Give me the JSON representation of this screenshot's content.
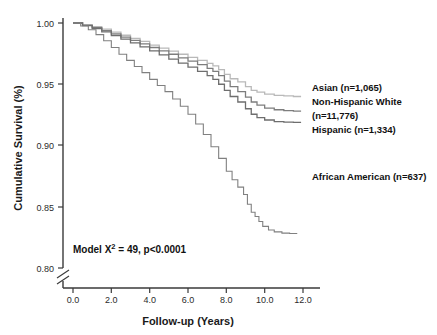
{
  "chart_data": {
    "type": "line",
    "title": "",
    "xlabel": "Follow-up (Years)",
    "ylabel": "Cumulative Survival (%)",
    "xlim": [
      0.0,
      12.0
    ],
    "ylim": [
      0.8,
      1.0
    ],
    "xticks": [
      "0.0",
      "2.0",
      "4.0",
      "6.0",
      "8.0",
      "10.0",
      "12.0"
    ],
    "xtick_values": [
      0.0,
      2.0,
      4.0,
      6.0,
      8.0,
      10.0,
      12.0
    ],
    "yticks": [
      "1.00",
      "0.95",
      "0.90",
      "0.85",
      "0.80"
    ],
    "ytick_values": [
      1.0,
      0.95,
      0.9,
      0.85,
      0.8
    ],
    "grid": false,
    "legend_position": "right-inline-labels",
    "axis_break": true,
    "axis_break_note": "y-axis broken below 0.80",
    "annotation": "Model X² = 49, p<0.0001",
    "annotation_parts": {
      "prefix": "Model X",
      "superscript": "2",
      "suffix": " = 49, p<0.0001"
    },
    "series": [
      {
        "name": "Asian",
        "label": "Asian (n=1,065)",
        "n": 1065,
        "color": "#b9b9b9",
        "final_value": 0.94,
        "x": [
          0.0,
          0.5,
          1.0,
          1.5,
          2.0,
          2.5,
          3.0,
          3.5,
          4.0,
          4.5,
          5.0,
          5.5,
          6.0,
          6.5,
          7.0,
          7.3,
          7.6,
          7.9,
          8.2,
          8.6,
          9.0,
          9.3,
          9.6,
          10.0,
          10.5,
          11.0,
          11.5,
          11.9
        ],
        "values": [
          1.0,
          0.9985,
          0.997,
          0.995,
          0.9925,
          0.99,
          0.9875,
          0.985,
          0.982,
          0.9795,
          0.977,
          0.9745,
          0.972,
          0.9695,
          0.967,
          0.965,
          0.962,
          0.958,
          0.9545,
          0.952,
          0.948,
          0.945,
          0.9435,
          0.942,
          0.941,
          0.9405,
          0.94,
          0.94
        ]
      },
      {
        "name": "Non-Hispanic White",
        "label_line1": "Non-Hispanic White",
        "label_line2": "(n=11,776)",
        "label": "Non-Hispanic White (n=11,776)",
        "n": 11776,
        "color": "#7d7d7d",
        "final_value": 0.928,
        "x": [
          0.0,
          0.5,
          1.0,
          1.5,
          2.0,
          2.5,
          3.0,
          3.5,
          4.0,
          4.5,
          5.0,
          5.5,
          6.0,
          6.5,
          7.0,
          7.3,
          7.6,
          7.9,
          8.2,
          8.6,
          9.0,
          9.3,
          9.6,
          10.0,
          10.5,
          11.0,
          11.5,
          11.9
        ],
        "values": [
          1.0,
          0.9982,
          0.9962,
          0.9938,
          0.9912,
          0.9885,
          0.9858,
          0.983,
          0.98,
          0.9772,
          0.9745,
          0.9715,
          0.9688,
          0.966,
          0.963,
          0.9605,
          0.957,
          0.9525,
          0.948,
          0.944,
          0.9395,
          0.9355,
          0.933,
          0.9305,
          0.9292,
          0.9285,
          0.928,
          0.928
        ]
      },
      {
        "name": "Hispanic",
        "label": "Hispanic (n=1,334)",
        "n": 1334,
        "color": "#6e6e6e",
        "final_value": 0.919,
        "x": [
          0.0,
          0.5,
          1.0,
          1.5,
          2.0,
          2.5,
          3.0,
          3.5,
          4.0,
          4.5,
          5.0,
          5.5,
          6.0,
          6.5,
          7.0,
          7.3,
          7.6,
          7.9,
          8.2,
          8.6,
          9.0,
          9.3,
          9.6,
          10.0,
          10.5,
          11.0,
          11.5,
          11.9
        ],
        "values": [
          1.0,
          0.9978,
          0.9955,
          0.9928,
          0.9898,
          0.9868,
          0.9838,
          0.9805,
          0.9772,
          0.974,
          0.9705,
          0.9672,
          0.964,
          0.9605,
          0.957,
          0.954,
          0.95,
          0.945,
          0.94,
          0.9355,
          0.93,
          0.9255,
          0.9228,
          0.9208,
          0.9195,
          0.919,
          0.9188,
          0.9188
        ]
      },
      {
        "name": "African American",
        "label": "African American (n=637)",
        "n": 637,
        "color": "#808080",
        "final_value": 0.828,
        "x": [
          0.0,
          0.4,
          0.8,
          1.2,
          1.6,
          2.0,
          2.4,
          2.8,
          3.2,
          3.6,
          4.0,
          4.4,
          4.8,
          5.2,
          5.6,
          6.0,
          6.4,
          6.8,
          7.2,
          7.6,
          8.0,
          8.3,
          8.6,
          8.9,
          9.1,
          9.3,
          9.5,
          9.7,
          9.9,
          10.2,
          10.5,
          10.9,
          11.3,
          11.7
        ],
        "values": [
          1.0,
          0.9975,
          0.9945,
          0.9905,
          0.9855,
          0.98,
          0.9745,
          0.9695,
          0.9645,
          0.9595,
          0.954,
          0.949,
          0.944,
          0.938,
          0.932,
          0.9255,
          0.9175,
          0.909,
          0.899,
          0.8895,
          0.879,
          0.872,
          0.866,
          0.86,
          0.852,
          0.8455,
          0.842,
          0.838,
          0.834,
          0.831,
          0.8295,
          0.8285,
          0.8282,
          0.8282
        ]
      }
    ]
  }
}
